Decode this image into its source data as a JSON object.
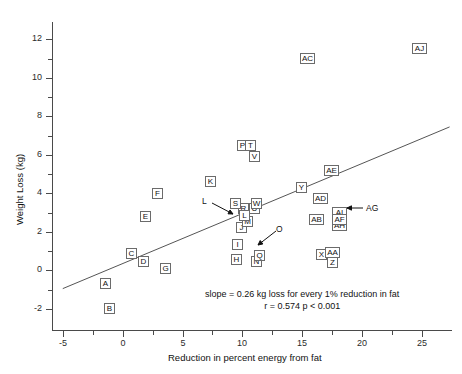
{
  "chart_data": {
    "type": "scatter",
    "title": "",
    "xlabel": "Reduction in percent energy from fat",
    "ylabel": "Weight Loss (kg)",
    "xlim": [
      -5.9,
      27.5
    ],
    "ylim": [
      -3.1,
      12.9
    ],
    "xticks": [
      -5,
      0,
      5,
      10,
      15,
      20,
      25
    ],
    "yticks": [
      -2,
      0,
      2,
      4,
      6,
      8,
      10,
      12
    ],
    "xminor": [
      -2.5,
      2.5,
      7.5,
      12.5,
      17.5,
      22.5
    ],
    "yminor": [
      -1,
      1,
      3,
      5,
      7,
      9,
      11,
      13
    ],
    "grid": false,
    "legend": null,
    "marker_style": "boxed-letter-label",
    "points": [
      {
        "label": "A",
        "x": -1.4,
        "y": -0.7
      },
      {
        "label": "B",
        "x": -1.1,
        "y": -2.0
      },
      {
        "label": "C",
        "x": 0.7,
        "y": 0.85
      },
      {
        "label": "D",
        "x": 1.7,
        "y": 0.45
      },
      {
        "label": "E",
        "x": 1.9,
        "y": 2.8
      },
      {
        "label": "F",
        "x": 2.9,
        "y": 4.0
      },
      {
        "label": "G",
        "x": 3.6,
        "y": 0.1
      },
      {
        "label": "H",
        "x": 9.5,
        "y": 0.55
      },
      {
        "label": "I",
        "x": 9.6,
        "y": 1.35
      },
      {
        "label": "J",
        "x": 9.9,
        "y": 2.2
      },
      {
        "label": "K",
        "x": 7.3,
        "y": 4.6
      },
      {
        "label": "L",
        "x": 10.2,
        "y": 2.85
      },
      {
        "label": "M",
        "x": 10.4,
        "y": 2.55
      },
      {
        "label": "N",
        "x": 11.2,
        "y": 0.45
      },
      {
        "label": "O",
        "x": 11.6,
        "y": 1.85
      },
      {
        "label": "P",
        "x": 10.0,
        "y": 6.5
      },
      {
        "label": "Q",
        "x": 11.4,
        "y": 0.75
      },
      {
        "label": "R",
        "x": 10.1,
        "y": 3.2
      },
      {
        "label": "S",
        "x": 9.4,
        "y": 3.45
      },
      {
        "label": "T",
        "x": 10.7,
        "y": 6.5
      },
      {
        "label": "U",
        "x": 11.0,
        "y": 3.2
      },
      {
        "label": "V",
        "x": 11.0,
        "y": 5.9
      },
      {
        "label": "W",
        "x": 11.2,
        "y": 3.45
      },
      {
        "label": "X",
        "x": 16.6,
        "y": 0.8
      },
      {
        "label": "Y",
        "x": 14.9,
        "y": 4.3
      },
      {
        "label": "Z",
        "x": 17.5,
        "y": 0.4
      },
      {
        "label": "AA",
        "x": 17.5,
        "y": 0.95
      },
      {
        "label": "AB",
        "x": 16.2,
        "y": 2.65
      },
      {
        "label": "AC",
        "x": 15.4,
        "y": 11.0
      },
      {
        "label": "AD",
        "x": 16.5,
        "y": 3.75
      },
      {
        "label": "AE",
        "x": 17.4,
        "y": 5.2
      },
      {
        "label": "AF",
        "x": 18.1,
        "y": 2.65
      },
      {
        "label": "AG",
        "x": 18.1,
        "y": 2.65
      },
      {
        "label": "AH",
        "x": 18.1,
        "y": 2.35
      },
      {
        "label": "AI",
        "x": 18.1,
        "y": 3.0
      },
      {
        "label": "AJ",
        "x": 24.8,
        "y": 11.5
      }
    ],
    "callouts": [
      {
        "label": "L",
        "points_to": "L-M cluster"
      },
      {
        "label": "O",
        "points_to": "Q-N cluster"
      },
      {
        "label": "AG",
        "points_to": "AI-AF-AH stack"
      }
    ],
    "fit_line": {
      "slope": 0.26,
      "x_start": -5.0,
      "y_start": -0.95,
      "x_end": 27.3,
      "y_end": 7.45
    },
    "annotation_line1": "slope = 0.26 kg loss for every 1% reduction in fat",
    "annotation_line2": "r = 0.574   p < 0.001"
  }
}
